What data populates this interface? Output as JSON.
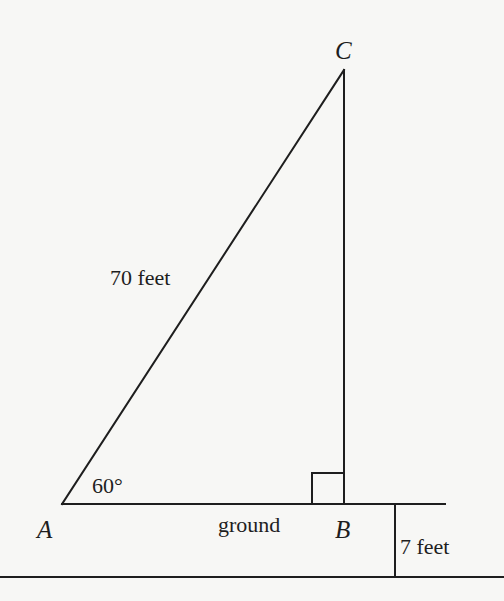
{
  "diagram": {
    "points": {
      "A": {
        "label": "A",
        "x": 62,
        "y": 504
      },
      "B": {
        "label": "B",
        "x": 344,
        "y": 504
      },
      "C": {
        "label": "C",
        "x": 344,
        "y": 70
      }
    },
    "labels": {
      "hypotenuse": "70 feet",
      "angle_A": "60°",
      "ground": "ground",
      "height_offset": "7 feet"
    },
    "colors": {
      "line": "#1e1e1e",
      "background": "#f7f7f5"
    }
  }
}
